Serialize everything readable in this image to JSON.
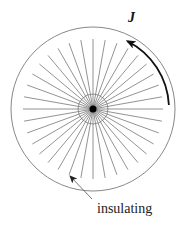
{
  "figure": {
    "current_label": "J",
    "insulating_label": "insulating",
    "spoke_count": 36,
    "colors": {
      "outer_circle": "#888888",
      "spokes": "#777777",
      "arrow": "#111111",
      "pointer": "#666666",
      "center_dot": "#000000"
    }
  }
}
